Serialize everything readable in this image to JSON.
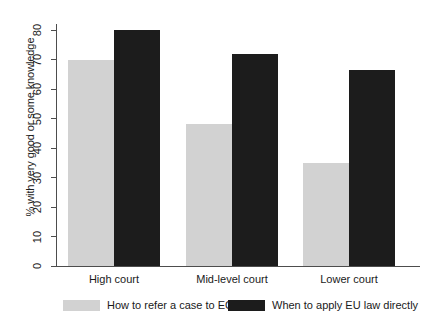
{
  "chart_data": {
    "type": "bar",
    "title": "",
    "xlabel": "",
    "ylabel": "% with very good or some knowledge",
    "categories": [
      "High court",
      "Mid-level court",
      "Lower court"
    ],
    "series": [
      {
        "name": "How to refer a case to ECJ",
        "color": "#d2d2d2",
        "values": [
          70,
          48,
          35
        ]
      },
      {
        "name": "When to apply EU law directly",
        "color": "#1c1c1c",
        "values": [
          80,
          72,
          66.5
        ]
      }
    ],
    "ylim": [
      0,
      80
    ],
    "yticks": [
      0,
      10,
      20,
      30,
      40,
      50,
      60,
      70,
      80
    ],
    "ytick_labels": [
      "0",
      "10",
      "20",
      "30",
      "40",
      "50",
      "60",
      "70",
      "80"
    ],
    "grid": false,
    "legend_position": "bottom",
    "axis_color": "#4d4d4d",
    "background": "#ffffff"
  },
  "legend": {
    "items": [
      {
        "label": "How to refer a case to ECJ",
        "color": "#d2d2d2"
      },
      {
        "label": "When to apply EU law directly",
        "color": "#1c1c1c"
      }
    ]
  }
}
